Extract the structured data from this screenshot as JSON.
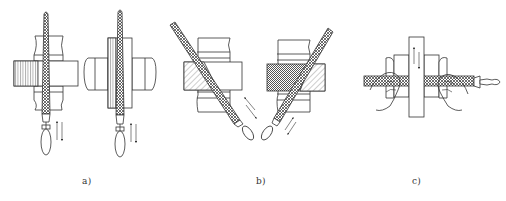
{
  "figure": {
    "panels": [
      {
        "id": "a",
        "caption": "a)",
        "content": "Straight (cross) filing: file held vertically through vise-clamped workpiece, two views, reciprocating arrows"
      },
      {
        "id": "b",
        "caption": "b)",
        "content": "Diagonal (cross-direction) filing: file held at angles across workpiece, left and right orientations, reciprocating arrows"
      },
      {
        "id": "c",
        "caption": "c)",
        "content": "Draw filing: file held horizontally with both hands across a narrow workpiece in a vise, vertical reciprocating arrows"
      }
    ]
  },
  "colors": {
    "line": "#333333",
    "hatch": "#555555",
    "background": "#ffffff"
  }
}
